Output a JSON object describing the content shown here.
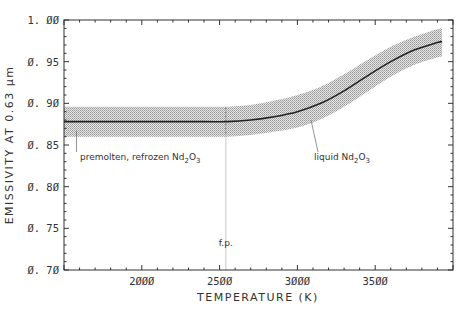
{
  "chart_data": {
    "type": "line",
    "title": "",
    "xlabel": "TEMPERATURE (K)",
    "ylabel": "EMISSIVITY AT 0.63 μm",
    "xlim": [
      1500,
      4000
    ],
    "ylim": [
      0.7,
      1.0
    ],
    "x_ticks": [
      2000,
      2500,
      3000,
      3500
    ],
    "x_tick_labels": [
      "2000",
      "2500",
      "3000",
      "3500"
    ],
    "y_ticks": [
      0.7,
      0.75,
      0.8,
      0.85,
      0.9,
      0.95,
      1.0
    ],
    "y_tick_labels": [
      "0.70",
      "0.75",
      "0.80",
      "0.85",
      "0.90",
      "0.95",
      "1.00"
    ],
    "x_minor_step": 100,
    "y_minor_step": 0.01,
    "grid": false,
    "legend": null,
    "series": [
      {
        "name": "emissivity",
        "x": [
          1500,
          1800,
          2100,
          2400,
          2550,
          2700,
          2850,
          3000,
          3150,
          3300,
          3450,
          3600,
          3750,
          3900,
          3930
        ],
        "y": [
          0.878,
          0.878,
          0.878,
          0.878,
          0.878,
          0.88,
          0.884,
          0.89,
          0.9,
          0.915,
          0.933,
          0.95,
          0.964,
          0.973,
          0.974
        ],
        "band_upper": [
          0.896,
          0.896,
          0.896,
          0.896,
          0.896,
          0.898,
          0.903,
          0.91,
          0.92,
          0.935,
          0.952,
          0.968,
          0.98,
          0.989,
          0.99
        ],
        "band_lower": [
          0.86,
          0.86,
          0.86,
          0.86,
          0.86,
          0.862,
          0.866,
          0.871,
          0.881,
          0.896,
          0.914,
          0.932,
          0.946,
          0.955,
          0.956
        ]
      }
    ],
    "annotations": [
      {
        "text": "premolten, refrozen Nd",
        "sub": "2",
        "text2": "O",
        "sub2": "3",
        "x": 1600,
        "y": 0.848,
        "pointer_x": 1580
      },
      {
        "text": "liquid  Nd",
        "sub": "2",
        "text2": "O",
        "sub2": "3",
        "x": 3200,
        "y": 0.848,
        "pointer_x": 3060
      },
      {
        "text": "f.p.",
        "x": 2540,
        "y": 0.718,
        "line_x": 2540,
        "line_top": 0.895
      }
    ]
  },
  "labels": {
    "xlabel": "TEMPERATURE (K)",
    "ylabel": "EMISSIVITY AT 0.63 μm",
    "ann_premolten": "premolten, refrozen Nd",
    "ann_liquid": "liquid  Nd",
    "sub2": "2",
    "o": "O",
    "sub3": "3",
    "fp": "f.p."
  }
}
